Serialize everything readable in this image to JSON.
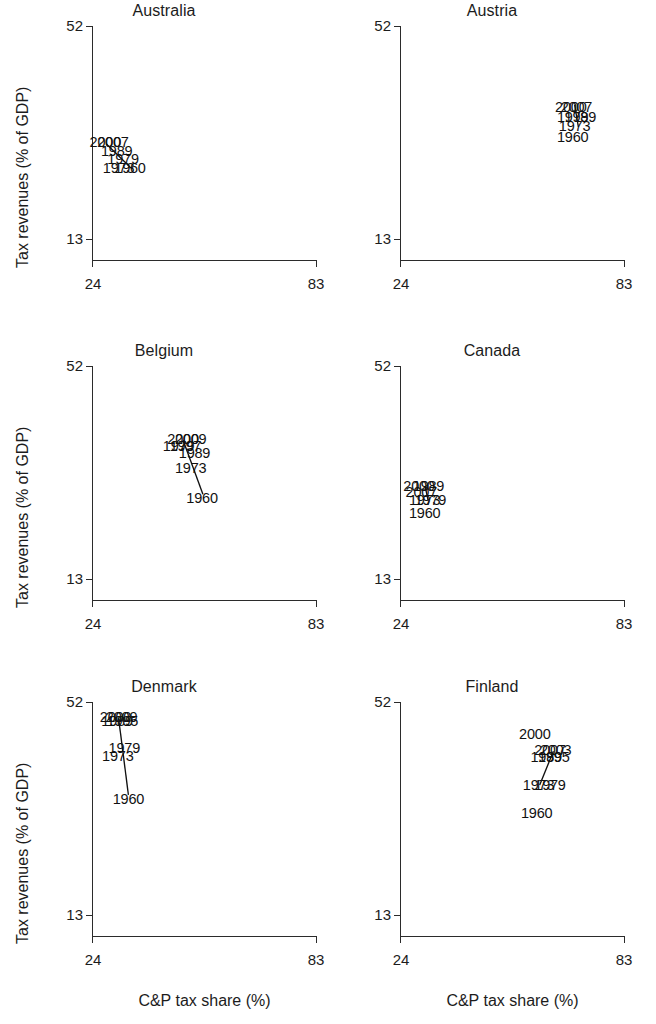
{
  "figure": {
    "ylabel": "Tax revenues (% of GDP)",
    "xlabel": "C&P tax share (%)",
    "y_ticks": [
      "52",
      "13"
    ],
    "x_ticks": [
      "24",
      "83"
    ]
  },
  "chart_data": {
    "type": "scatter",
    "title": "",
    "subtitle": "",
    "xlabel": "C&P tax share (%)",
    "ylabel": "Tax revenues (% of GDP)",
    "xlim": [
      24,
      83
    ],
    "ylim": [
      13,
      52
    ],
    "x_ticks": [
      24,
      83
    ],
    "y_ticks": [
      13,
      52
    ],
    "grid": false,
    "legend": "none",
    "point_labels_are_years": true,
    "layout": {
      "rows": 3,
      "cols": 2,
      "panel_order": [
        "Australia",
        "Austria",
        "Belgium",
        "Canada",
        "Denmark",
        "Finland"
      ]
    },
    "panels": [
      {
        "title": "Australia",
        "points": [
          {
            "year": "2000",
            "x": 27.5,
            "y": 30.8
          },
          {
            "year": "2007",
            "x": 29.5,
            "y": 30.8
          },
          {
            "year": "1989",
            "x": 30.5,
            "y": 29.2
          },
          {
            "year": "1979",
            "x": 32.2,
            "y": 27.6
          },
          {
            "year": "1973",
            "x": 31.0,
            "y": 26.1
          },
          {
            "year": "1960",
            "x": 34.0,
            "y": 26.1
          }
        ]
      },
      {
        "title": "Austria",
        "points": [
          {
            "year": "2000",
            "x": 69.0,
            "y": 37.2
          },
          {
            "year": "2007",
            "x": 70.5,
            "y": 37.2
          },
          {
            "year": "1989",
            "x": 71.5,
            "y": 35.4
          },
          {
            "year": "1979",
            "x": 69.5,
            "y": 35.4
          },
          {
            "year": "1973",
            "x": 70.0,
            "y": 33.7
          },
          {
            "year": "1960",
            "x": 69.5,
            "y": 31.6
          }
        ]
      },
      {
        "title": "Belgium",
        "points": [
          {
            "year": "2000",
            "x": 48.0,
            "y": 38.6
          },
          {
            "year": "2009",
            "x": 50.0,
            "y": 38.6
          },
          {
            "year": "1979",
            "x": 46.8,
            "y": 37.3
          },
          {
            "year": "1997",
            "x": 48.6,
            "y": 37.3
          },
          {
            "year": "1989",
            "x": 51.0,
            "y": 36.1
          },
          {
            "year": "1973",
            "x": 50.0,
            "y": 33.3
          },
          {
            "year": "1960",
            "x": 53.0,
            "y": 27.9
          }
        ]
      },
      {
        "title": "Canada",
        "points": [
          {
            "year": "2000",
            "x": 29.0,
            "y": 30.1
          },
          {
            "year": "1989",
            "x": 31.5,
            "y": 30.1
          },
          {
            "year": "2007",
            "x": 29.6,
            "y": 28.9
          },
          {
            "year": "1973",
            "x": 30.5,
            "y": 27.5
          },
          {
            "year": "1979",
            "x": 32.0,
            "y": 27.5
          },
          {
            "year": "1960",
            "x": 30.5,
            "y": 25.1
          }
        ]
      },
      {
        "title": "Denmark",
        "points": [
          {
            "year": "2000",
            "x": 30.2,
            "y": 49.3
          },
          {
            "year": "2009",
            "x": 31.8,
            "y": 49.3
          },
          {
            "year": "1989",
            "x": 30.6,
            "y": 48.6
          },
          {
            "year": "1995",
            "x": 32.0,
            "y": 48.6
          },
          {
            "year": "1979",
            "x": 32.5,
            "y": 43.5
          },
          {
            "year": "1973",
            "x": 30.8,
            "y": 42.1
          },
          {
            "year": "1960",
            "x": 33.6,
            "y": 34.2
          }
        ]
      },
      {
        "title": "Finland",
        "points": [
          {
            "year": "2000",
            "x": 59.5,
            "y": 46.2
          },
          {
            "year": "2007",
            "x": 63.5,
            "y": 43.2
          },
          {
            "year": "2003",
            "x": 65.0,
            "y": 43.2
          },
          {
            "year": "1989",
            "x": 62.5,
            "y": 41.9
          },
          {
            "year": "1995",
            "x": 64.5,
            "y": 41.9
          },
          {
            "year": "1973",
            "x": 60.5,
            "y": 36.8
          },
          {
            "year": "1979",
            "x": 63.5,
            "y": 36.8
          },
          {
            "year": "1960",
            "x": 60.0,
            "y": 31.7
          }
        ]
      }
    ],
    "connectors": [
      {
        "panel": "Australia",
        "path": [
          [
            27.8,
            30.4
          ],
          [
            34.0,
            26.2
          ]
        ]
      },
      {
        "panel": "Austria",
        "path": [
          [
            70.0,
            37.6
          ],
          [
            71.0,
            33.5
          ]
        ]
      },
      {
        "panel": "Belgium",
        "path": [
          [
            48.0,
            38.4
          ],
          [
            53.2,
            28.5
          ]
        ]
      },
      {
        "panel": "Canada",
        "path": [
          [
            30.6,
            30.0
          ],
          [
            31.4,
            27.4
          ]
        ]
      },
      {
        "panel": "Denmark",
        "path": [
          [
            31.0,
            49.0
          ],
          [
            33.6,
            35.0
          ]
        ]
      },
      {
        "panel": "Finland",
        "path": [
          [
            60.8,
            36.8
          ],
          [
            64.4,
            43.0
          ]
        ]
      }
    ]
  }
}
